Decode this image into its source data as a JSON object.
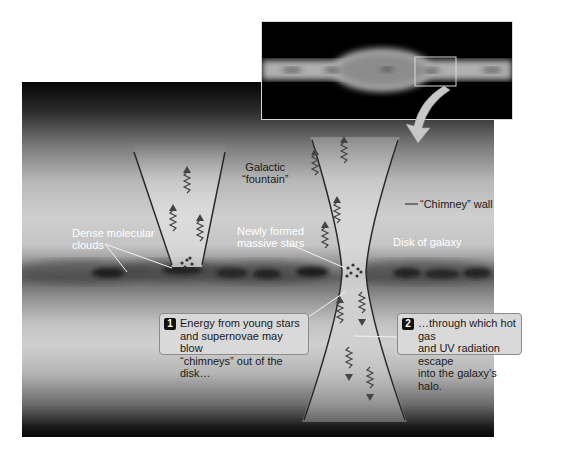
{
  "figure": {
    "inset": {
      "description": "Edge-on view of galaxy with zoom box",
      "colors": {
        "background": "#000000",
        "disk": "#bdbdbd",
        "box": "#d9d9d9"
      }
    },
    "labels": {
      "galactic_fountain": [
        "Galactic",
        "“fountain”"
      ],
      "dense_molecular_clouds": [
        "Dense molecular",
        "clouds"
      ],
      "newly_formed_stars": [
        "Newly formed",
        "massive stars"
      ],
      "chimney_wall": "“Chimney” wall",
      "disk_of_galaxy": "Disk of galaxy"
    },
    "callouts": [
      {
        "number": "1",
        "lines": [
          "Energy from young stars",
          "and supernovae may blow",
          "“chimneys” out of the disk…"
        ]
      },
      {
        "number": "2",
        "lines": [
          "…through which hot gas",
          "and UV radiation escape",
          "into the galaxy’s halo."
        ]
      }
    ],
    "colors": {
      "panel_dark": "#050505",
      "panel_light": "#cfcfcf",
      "disk_band": "#5e5e5e",
      "callout_bg": "#d9d9d9",
      "badge_bg": "#111111",
      "wall_line": "#2a2a2a",
      "arrow": "#c8c8c8"
    }
  }
}
